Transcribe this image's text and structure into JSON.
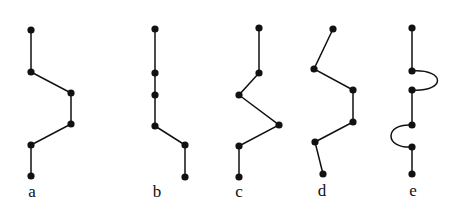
{
  "diagram": {
    "colors": {
      "line": "#111111",
      "node": "#111111",
      "background": "#ffffff"
    },
    "node_radius": 3.6,
    "figures": [
      {
        "id": "a",
        "label": "a",
        "label_pos": [
          32,
          192
        ],
        "nodes": [
          [
            31,
            30
          ],
          [
            31,
            72
          ],
          [
            71,
            93
          ],
          [
            71,
            124
          ],
          [
            31,
            145
          ],
          [
            31,
            176
          ]
        ],
        "edges": "polyline"
      },
      {
        "id": "b",
        "label": "b",
        "label_pos": [
          157,
          192
        ],
        "nodes": [
          [
            155,
            29
          ],
          [
            155,
            73
          ],
          [
            155,
            95
          ],
          [
            155,
            126
          ],
          [
            185,
            145
          ],
          [
            185,
            177
          ]
        ],
        "edges": "polyline"
      },
      {
        "id": "c",
        "label": "c",
        "label_pos": [
          239,
          192
        ],
        "nodes": [
          [
            259,
            28
          ],
          [
            259,
            73
          ],
          [
            239,
            95
          ],
          [
            279,
            125
          ],
          [
            239,
            146
          ],
          [
            239,
            177
          ]
        ],
        "edges": "polyline"
      },
      {
        "id": "d",
        "label": "d",
        "label_pos": [
          322,
          191
        ],
        "nodes": [
          [
            333,
            29
          ],
          [
            314,
            69
          ],
          [
            353,
            90
          ],
          [
            353,
            122
          ],
          [
            315,
            142
          ],
          [
            323,
            174
          ]
        ],
        "edges": "polyline"
      },
      {
        "id": "e",
        "label": "e",
        "label_pos": [
          413,
          191
        ],
        "nodes": [
          [
            412,
            28
          ],
          [
            412,
            71
          ],
          [
            412,
            90
          ],
          [
            412,
            125
          ],
          [
            412,
            147
          ],
          [
            412,
            174
          ]
        ],
        "edges": "mixed",
        "segments": [
          {
            "type": "line",
            "from": 0,
            "to": 1
          },
          {
            "type": "arc",
            "from": 1,
            "to": 2,
            "bulge": "right",
            "extent": 446
          },
          {
            "type": "line",
            "from": 2,
            "to": 3
          },
          {
            "type": "arc",
            "from": 3,
            "to": 4,
            "bulge": "left",
            "extent": 384
          },
          {
            "type": "line",
            "from": 4,
            "to": 5
          }
        ]
      }
    ]
  }
}
